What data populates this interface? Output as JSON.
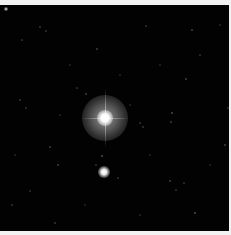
{
  "image": {
    "description": "Astronomical star field with a bright central star surrounded by a halo and a fainter companion star below",
    "background_color": "#020202",
    "border_color": "#f2f2f2"
  },
  "primary_star": {
    "x": 105,
    "y": 113,
    "halo_radius": 23,
    "core_radius": 4,
    "color": "#ffffff",
    "halo_color": "#9a9a9a"
  },
  "secondary_star": {
    "x": 104,
    "y": 167,
    "core_radius": 3,
    "color": "#ffffff"
  },
  "field_stars": [
    [
      6,
      4,
      1.6,
      0.9
    ],
    [
      40,
      22,
      1,
      0.5
    ],
    [
      46,
      26,
      0.8,
      0.4
    ],
    [
      22,
      35,
      0.8,
      0.4
    ],
    [
      97,
      44,
      1,
      0.6
    ],
    [
      146,
      21,
      0.8,
      0.4
    ],
    [
      192,
      25,
      1,
      0.6
    ],
    [
      186,
      74,
      1,
      0.6
    ],
    [
      172,
      108,
      1,
      0.7
    ],
    [
      171,
      117,
      0.8,
      0.5
    ],
    [
      143,
      122,
      1,
      0.5
    ],
    [
      140,
      118,
      0.8,
      0.4
    ],
    [
      86,
      89,
      1,
      0.6
    ],
    [
      77,
      83,
      0.8,
      0.4
    ],
    [
      20,
      95,
      1,
      0.5
    ],
    [
      26,
      103,
      0.8,
      0.4
    ],
    [
      50,
      142,
      1,
      0.6
    ],
    [
      58,
      160,
      1,
      0.6
    ],
    [
      102,
      151,
      1,
      0.7
    ],
    [
      96,
      160,
      0.8,
      0.4
    ],
    [
      118,
      173,
      0.8,
      0.4
    ],
    [
      170,
      176,
      1,
      0.6
    ],
    [
      184,
      178,
      0.8,
      0.4
    ],
    [
      195,
      208,
      1,
      0.7
    ],
    [
      176,
      185,
      0.8,
      0.4
    ],
    [
      30,
      186,
      0.8,
      0.4
    ],
    [
      12,
      200,
      0.8,
      0.4
    ],
    [
      55,
      218,
      1,
      0.5
    ],
    [
      225,
      140,
      1,
      0.6
    ],
    [
      228,
      103,
      0.8,
      0.4
    ],
    [
      200,
      50,
      0.8,
      0.4
    ],
    [
      160,
      60,
      0.8,
      0.3
    ],
    [
      120,
      70,
      0.8,
      0.3
    ],
    [
      70,
      60,
      0.8,
      0.3
    ],
    [
      15,
      150,
      0.8,
      0.3
    ],
    [
      85,
      200,
      0.8,
      0.3
    ],
    [
      140,
      210,
      0.8,
      0.3
    ],
    [
      210,
      160,
      0.8,
      0.3
    ],
    [
      220,
      20,
      0.8,
      0.3
    ],
    [
      130,
      100,
      0.8,
      0.3
    ],
    [
      60,
      110,
      0.8,
      0.3
    ],
    [
      150,
      150,
      0.8,
      0.3
    ]
  ]
}
